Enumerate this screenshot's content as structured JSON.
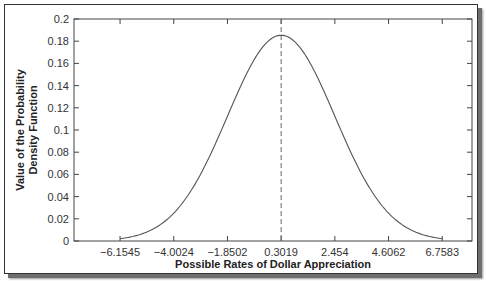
{
  "chart_data": {
    "type": "line",
    "title": "",
    "xlabel": "Possible Rates of Dollar Appreciation",
    "ylabel": "Value of the Probability Density Function",
    "ylabel_lines": [
      "Value of the Probability",
      "Density Function"
    ],
    "xlim": [
      -8.0,
      7.95
    ],
    "ylim": [
      0,
      0.2
    ],
    "grid": false,
    "legend": null,
    "x_ticks": [
      -6.1545,
      -4.0024,
      -1.8502,
      0.3019,
      2.454,
      4.6062,
      6.7583
    ],
    "x_tick_labels": [
      "−6.1545",
      "−4.0024",
      "−1.8502",
      "0.3019",
      "2.454",
      "4.6062",
      "6.7583"
    ],
    "y_ticks": [
      0,
      0.02,
      0.04,
      0.06,
      0.08,
      0.1,
      0.12,
      0.14,
      0.16,
      0.18,
      0.2
    ],
    "y_tick_labels": [
      "0",
      "0.02",
      "0.04",
      "0.06",
      "0.08",
      "0.1",
      "0.12",
      "0.14",
      "0.16",
      "0.18",
      "0.2"
    ],
    "series": [
      {
        "name": "Normal PDF",
        "distribution": "normal",
        "mean": 0.3019,
        "std": 2.1522,
        "x_range": [
          -6.1545,
          6.7583
        ],
        "peak": 0.1854
      }
    ],
    "annotations": [
      {
        "type": "vertical-dashed-line",
        "x": 0.3019,
        "label": "mean"
      }
    ]
  },
  "colors": {
    "curve": "#555555",
    "axes": "#444444",
    "mean_line": "#666666"
  }
}
